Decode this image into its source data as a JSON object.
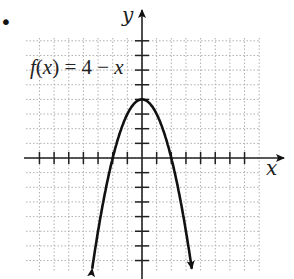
{
  "chart_data": {
    "type": "line",
    "title": "",
    "annotation": "f(x) = 4 − x",
    "function_plotted": "4 - x^2",
    "xlabel": "x",
    "ylabel": "y",
    "xlim": [
      -7,
      7
    ],
    "ylim": [
      -7,
      8
    ],
    "grid": true,
    "tick_spacing": 1,
    "series": [
      {
        "name": "f(x)",
        "x": [
          -3.4,
          -3,
          -2,
          -1,
          0,
          1,
          2,
          3,
          3.4
        ],
        "y": [
          -7.56,
          -5,
          0,
          3,
          4,
          3,
          0,
          -5,
          -7.56
        ]
      }
    ],
    "key_points": {
      "vertex": [
        0,
        4
      ],
      "x_intercepts": [
        -2,
        2
      ]
    },
    "legend": []
  },
  "labels": {
    "equation": "f(x) = 4 − x",
    "x_axis": "x",
    "y_axis": "y",
    "bullet": "•"
  },
  "style": {
    "curve_color": "#111111",
    "grid_color": "#b0b0b0",
    "axis_color": "#222222"
  }
}
